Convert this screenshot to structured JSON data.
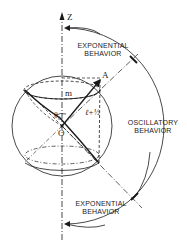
{
  "diagram": {
    "axis_label": "Z",
    "point_a_label": "A",
    "projection_label": "m",
    "vector_length_label": "ℓ+½",
    "angle_label": "θ₀",
    "origin_label": "O",
    "regions": {
      "top": {
        "line1": "EXPONENTIAL",
        "line2": "BEHAVIOR"
      },
      "middle": {
        "line1": "OSCILLATORY",
        "line2": "BEHAVIOR"
      },
      "bottom": {
        "line1": "EXPONENTIAL",
        "line2": "BEHAVIOR"
      }
    },
    "colors": {
      "ink": "#1a1a1a",
      "background": "#ffffff"
    }
  }
}
